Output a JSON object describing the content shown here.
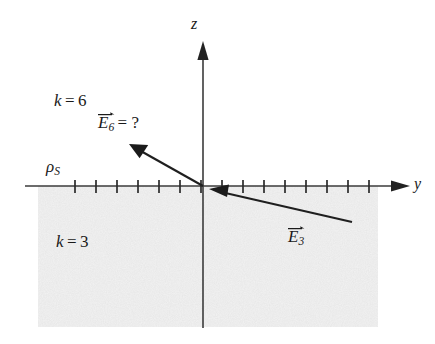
{
  "figure": {
    "width": 435,
    "height": 344,
    "background_color": "#ffffff",
    "ink_color": "#1a1a1a",
    "shaded_region_color": "#ededed"
  },
  "axes": {
    "vertical": {
      "label": "z",
      "x": 203,
      "top_y": 42,
      "bottom_y": 328,
      "arrow_at": "top"
    },
    "horizontal": {
      "label": "y",
      "y": 186,
      "left_x": 25,
      "right_x": 410,
      "arrow_at": "right"
    },
    "origin": {
      "x": 203,
      "y": 186
    }
  },
  "interface": {
    "charge_label": "ρ",
    "charge_subscript": "S",
    "tick_count": 16,
    "tick_spacing": 21,
    "tick_first_x": 75,
    "tick_half_height": 6
  },
  "regions": {
    "upper": {
      "constant_symbol": "k",
      "equals": "=",
      "constant_value": "6",
      "label": "k = 6"
    },
    "lower": {
      "constant_symbol": "k",
      "equals": "=",
      "constant_value": "3",
      "label": "k = 3",
      "shaded": true,
      "bounds": {
        "x1": 38,
        "y1": 186,
        "x2": 378,
        "y2": 327
      }
    }
  },
  "vectors": [
    {
      "name": "E6",
      "symbol": "E",
      "subscript": "6",
      "suffix": "= ?",
      "label": "E₆ = ?",
      "tail": {
        "x": 203,
        "y": 186
      },
      "tip": {
        "x": 131,
        "y": 145
      },
      "points_away_from_origin": true
    },
    {
      "name": "E3",
      "symbol": "E",
      "subscript": "3",
      "suffix": "",
      "label": "E₃",
      "tail": {
        "x": 352,
        "y": 222
      },
      "tip": {
        "x": 211,
        "y": 190
      },
      "points_away_from_origin": false
    }
  ],
  "icons": {
    "axis_arrow": "triangle-arrowhead-icon",
    "vector_arrow": "vector-arrowhead-icon",
    "tick": "tick-mark-icon",
    "vector_accent": "vector-overbar-arrow-icon"
  }
}
